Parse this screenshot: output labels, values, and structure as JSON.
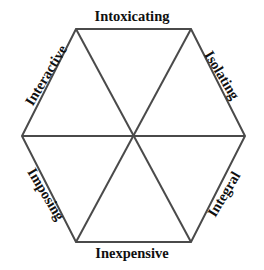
{
  "diagram": {
    "type": "hexagon-wheel",
    "shape": "regular-hexagon",
    "segments": 6,
    "background_color": "#ffffff",
    "line_color": "#4a4a4a",
    "line_width": 2,
    "text_color": "#101010",
    "geometry": {
      "center_x": 133,
      "center_y": 136,
      "vertices": [
        {
          "name": "top-left",
          "x": 76,
          "y": 29
        },
        {
          "name": "top-right",
          "x": 191,
          "y": 29
        },
        {
          "name": "right",
          "x": 245,
          "y": 136
        },
        {
          "name": "bottom-right",
          "x": 191,
          "y": 242
        },
        {
          "name": "bottom-left",
          "x": 76,
          "y": 242
        },
        {
          "name": "left",
          "x": 22,
          "y": 136
        }
      ],
      "diagonals": [
        {
          "name": "horizontal-diagonal",
          "from": "left",
          "to": "right"
        },
        {
          "name": "top-left-to-bottom-right-diagonal",
          "from": "top-left",
          "to": "bottom-right"
        },
        {
          "name": "top-right-to-bottom-left-diagonal",
          "from": "top-right",
          "to": "bottom-left"
        }
      ]
    },
    "labels": {
      "top": "Intoxicating",
      "upper_right": "Isolating",
      "lower_right": "Integral",
      "bottom": "Inexpensive",
      "lower_left": "Imposing",
      "upper_left": "Interactive"
    },
    "label_rotations": {
      "top": 0,
      "upper_right": 59,
      "lower_right": -59,
      "bottom": 0,
      "lower_left": 59,
      "upper_left": -59
    }
  }
}
